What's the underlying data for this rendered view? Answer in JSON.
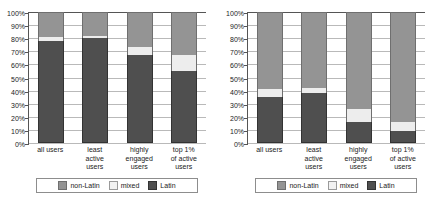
{
  "chart_data": [
    {
      "id": "left",
      "type": "bar",
      "subtype": "stacked-100-percent",
      "title": "",
      "xlabel": "",
      "ylabel": "",
      "ylim": [
        0,
        100
      ],
      "ytick_labels": [
        "100%",
        "90%",
        "80%",
        "70%",
        "60%",
        "50%",
        "40%",
        "30%",
        "20%",
        "10%",
        "0%"
      ],
      "ytick_values": [
        100,
        90,
        80,
        70,
        60,
        50,
        40,
        30,
        20,
        10,
        0
      ],
      "grid": true,
      "legend_position": "bottom",
      "categories": [
        "all users",
        "least active users",
        "highly engaged users",
        "top 1% of active users"
      ],
      "category_lines": [
        [
          "all users"
        ],
        [
          "least",
          "active",
          "users"
        ],
        [
          "highly",
          "engaged",
          "users"
        ],
        [
          "top 1%",
          "of active",
          "users"
        ]
      ],
      "series": [
        {
          "name": "Latin",
          "values": [
            78,
            80,
            67,
            55
          ],
          "color": "#4f4f4f"
        },
        {
          "name": "mixed",
          "values": [
            3,
            2,
            6,
            12
          ],
          "color": "#ededed"
        },
        {
          "name": "non-Latin",
          "values": [
            19,
            18,
            27,
            33
          ],
          "color": "#949494"
        }
      ],
      "legend": [
        "non-Latin",
        "mixed",
        "Latin"
      ]
    },
    {
      "id": "right",
      "type": "bar",
      "subtype": "stacked-100-percent",
      "title": "",
      "xlabel": "",
      "ylabel": "",
      "ylim": [
        0,
        100
      ],
      "ytick_labels": [
        "100%",
        "90%",
        "80%",
        "70%",
        "60%",
        "50%",
        "40%",
        "30%",
        "20%",
        "10%",
        "0%"
      ],
      "ytick_values": [
        100,
        90,
        80,
        70,
        60,
        50,
        40,
        30,
        20,
        10,
        0
      ],
      "grid": true,
      "legend_position": "bottom",
      "categories": [
        "all users",
        "least active users",
        "highly engaged users",
        "top 1% of active users"
      ],
      "category_lines": [
        [
          "all users"
        ],
        [
          "least",
          "active",
          "users"
        ],
        [
          "highly",
          "engaged",
          "users"
        ],
        [
          "top 1%",
          "of active",
          "users"
        ]
      ],
      "series": [
        {
          "name": "Latin",
          "values": [
            35,
            38,
            16,
            9
          ],
          "color": "#4f4f4f"
        },
        {
          "name": "mixed",
          "values": [
            6,
            4,
            10,
            7
          ],
          "color": "#ededed"
        },
        {
          "name": "non-Latin",
          "values": [
            59,
            58,
            74,
            84
          ],
          "color": "#949494"
        }
      ],
      "legend": [
        "non-Latin",
        "mixed",
        "Latin"
      ]
    }
  ]
}
